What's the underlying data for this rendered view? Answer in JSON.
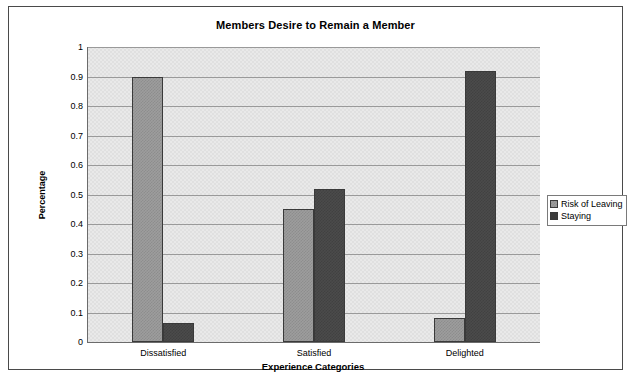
{
  "chart_data": {
    "type": "bar",
    "title": "Members Desire to Remain a Member",
    "xlabel": "Experience Categories",
    "ylabel": "Percentage",
    "categories": [
      "Dissatisfied",
      "Satisfied",
      "Delighted"
    ],
    "series": [
      {
        "name": "Risk of Leaving",
        "values": [
          0.9,
          0.45,
          0.08
        ],
        "color": "#9d9d9d"
      },
      {
        "name": "Staying",
        "values": [
          0.065,
          0.52,
          0.92
        ],
        "color": "#4b4b4b"
      }
    ],
    "ylim": [
      0,
      1
    ],
    "yticks": [
      "0",
      "0.1",
      "0.2",
      "0.3",
      "0.4",
      "0.5",
      "0.6",
      "0.7",
      "0.8",
      "0.9",
      "1"
    ],
    "ytick_values": [
      0,
      0.1,
      0.2,
      0.3,
      0.4,
      0.5,
      0.6,
      0.7,
      0.8,
      0.9,
      1
    ],
    "grid": "horizontal",
    "legend_position": "right-outside"
  }
}
